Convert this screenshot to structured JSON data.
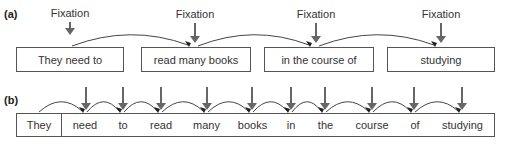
{
  "panel_a": {
    "label": "(a)",
    "fixation_label": "Fixation",
    "chunks": [
      {
        "text": "They need to",
        "x": 16,
        "w": 108,
        "fix_x": 70
      },
      {
        "text": "read many books",
        "x": 141,
        "w": 110,
        "fix_x": 195
      },
      {
        "text": "in the course of",
        "x": 264,
        "w": 110,
        "fix_x": 316
      },
      {
        "text": "studying",
        "x": 387,
        "w": 108,
        "fix_x": 441
      }
    ]
  },
  "panel_b": {
    "label": "(b)",
    "words": [
      {
        "text": "They",
        "x": 16,
        "w": 46
      },
      {
        "text": "need",
        "x": 62,
        "w": 46
      },
      {
        "text": "to",
        "x": 108,
        "w": 30
      },
      {
        "text": "read",
        "x": 138,
        "w": 46
      },
      {
        "text": "many",
        "x": 184,
        "w": 45
      },
      {
        "text": "books",
        "x": 229,
        "w": 47
      },
      {
        "text": "in",
        "x": 276,
        "w": 30
      },
      {
        "text": "the",
        "x": 306,
        "w": 39
      },
      {
        "text": "course",
        "x": 345,
        "w": 54
      },
      {
        "text": "of",
        "x": 399,
        "w": 32
      },
      {
        "text": "studying",
        "x": 431,
        "w": 63
      }
    ]
  },
  "colors": {
    "arrow": "#666666",
    "line": "#444444",
    "border": "#555555"
  }
}
